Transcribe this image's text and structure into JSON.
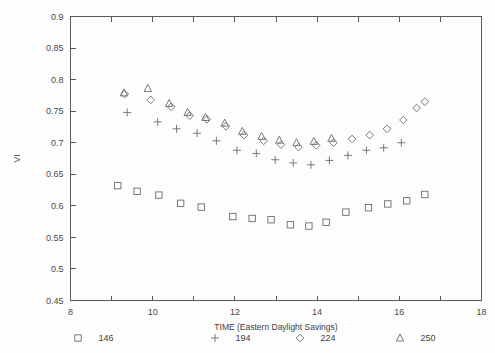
{
  "chart_data": {
    "type": "scatter",
    "title": "",
    "xlabel": "TIME (Eastern Daylight Savings)",
    "ylabel": "VI",
    "xlim": [
      8,
      18
    ],
    "ylim": [
      0.45,
      0.9
    ],
    "xticks": [
      8,
      9,
      10,
      11,
      12,
      13,
      14,
      15,
      16,
      17,
      18
    ],
    "xtick_labels": [
      "8",
      "",
      "10",
      "",
      "12",
      "",
      "14",
      "",
      "16",
      "",
      "18"
    ],
    "yticks": [
      0.45,
      0.5,
      0.55,
      0.6,
      0.65,
      0.7,
      0.75,
      0.8,
      0.85,
      0.9
    ],
    "ytick_labels": [
      "0.45",
      "0.5",
      "0.55",
      "0.6",
      "0.65",
      "0.7",
      "0.75",
      "0.8",
      "0.85",
      "0.9"
    ],
    "grid": false,
    "legend_position": "below",
    "series": [
      {
        "name": "146",
        "marker": "square",
        "points": [
          [
            9.15,
            0.632
          ],
          [
            9.62,
            0.623
          ],
          [
            10.15,
            0.617
          ],
          [
            10.68,
            0.604
          ],
          [
            11.18,
            0.598
          ],
          [
            11.95,
            0.583
          ],
          [
            12.42,
            0.58
          ],
          [
            12.88,
            0.578
          ],
          [
            13.35,
            0.57
          ],
          [
            13.8,
            0.568
          ],
          [
            14.22,
            0.574
          ],
          [
            14.7,
            0.59
          ],
          [
            15.25,
            0.597
          ],
          [
            15.72,
            0.603
          ],
          [
            16.18,
            0.608
          ],
          [
            16.62,
            0.618
          ]
        ]
      },
      {
        "name": "194",
        "marker": "plus",
        "points": [
          [
            9.38,
            0.748
          ],
          [
            10.12,
            0.733
          ],
          [
            10.58,
            0.722
          ],
          [
            11.08,
            0.715
          ],
          [
            11.55,
            0.703
          ],
          [
            12.05,
            0.688
          ],
          [
            12.52,
            0.683
          ],
          [
            12.98,
            0.673
          ],
          [
            13.42,
            0.668
          ],
          [
            13.85,
            0.665
          ],
          [
            14.3,
            0.672
          ],
          [
            14.75,
            0.68
          ],
          [
            15.2,
            0.688
          ],
          [
            15.62,
            0.692
          ],
          [
            16.05,
            0.7
          ]
        ]
      },
      {
        "name": "224",
        "marker": "diamond",
        "points": [
          [
            9.32,
            0.777
          ],
          [
            9.95,
            0.768
          ],
          [
            10.45,
            0.757
          ],
          [
            10.9,
            0.743
          ],
          [
            11.32,
            0.737
          ],
          [
            11.78,
            0.726
          ],
          [
            12.22,
            0.712
          ],
          [
            12.7,
            0.703
          ],
          [
            13.12,
            0.697
          ],
          [
            13.55,
            0.693
          ],
          [
            13.98,
            0.696
          ],
          [
            14.4,
            0.7
          ],
          [
            14.85,
            0.706
          ],
          [
            15.28,
            0.712
          ],
          [
            15.7,
            0.722
          ],
          [
            16.1,
            0.736
          ],
          [
            16.42,
            0.755
          ],
          [
            16.62,
            0.765
          ]
        ]
      },
      {
        "name": "250",
        "marker": "triangle",
        "points": [
          [
            9.3,
            0.779
          ],
          [
            9.88,
            0.786
          ],
          [
            10.4,
            0.762
          ],
          [
            10.85,
            0.748
          ],
          [
            11.28,
            0.74
          ],
          [
            11.75,
            0.731
          ],
          [
            12.18,
            0.718
          ],
          [
            12.65,
            0.71
          ],
          [
            13.08,
            0.704
          ],
          [
            13.5,
            0.7
          ],
          [
            13.92,
            0.702
          ],
          [
            14.35,
            0.707
          ]
        ]
      }
    ]
  },
  "legend": {
    "entries": [
      {
        "marker": "square",
        "label": "146"
      },
      {
        "marker": "plus",
        "label": "194"
      },
      {
        "marker": "diamond",
        "label": "224"
      },
      {
        "marker": "triangle",
        "label": "250"
      }
    ]
  },
  "colors": {
    "axis": "#5a5a5a",
    "marker": "#6b6b6b",
    "text": "#3f3f3f",
    "background": "#fdfdfd"
  }
}
